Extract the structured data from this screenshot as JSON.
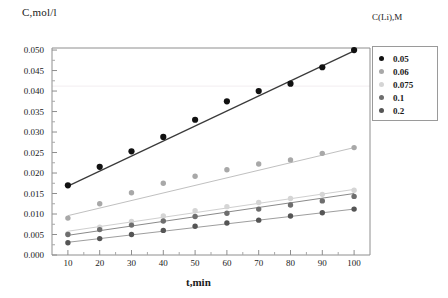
{
  "chart_data": {
    "type": "scatter",
    "title": "",
    "xlabel": "t,min",
    "ylabel": "C,mol/l",
    "xlim": [
      5,
      105
    ],
    "ylim": [
      0.0,
      0.0505
    ],
    "grid": false,
    "legend_position": "right",
    "legend_title": "C(Li),M",
    "xticks": [
      10,
      20,
      30,
      40,
      50,
      60,
      70,
      80,
      90,
      100
    ],
    "yticks": [
      "0.000",
      "0.005",
      "0.010",
      "0.015",
      "0.020",
      "0.025",
      "0.030",
      "0.035",
      "0.040",
      "0.045",
      "0.050"
    ],
    "x": [
      10,
      20,
      30,
      40,
      50,
      60,
      70,
      80,
      90,
      100
    ],
    "series": [
      {
        "name": "0.05",
        "color": "#111111",
        "values": [
          0.017,
          0.0215,
          0.0253,
          0.0288,
          0.033,
          0.0375,
          0.04,
          0.0418,
          0.0458,
          0.05
        ]
      },
      {
        "name": "0.06",
        "color": "#a8a8a8",
        "values": [
          0.009,
          0.0125,
          0.0152,
          0.0175,
          0.0192,
          0.0208,
          0.0222,
          0.0232,
          0.0248,
          0.0262
        ]
      },
      {
        "name": "0.075",
        "color": "#d5d5d5",
        "values": [
          0.0052,
          0.0068,
          0.0082,
          0.0095,
          0.0108,
          0.0118,
          0.0128,
          0.0138,
          0.0148,
          0.0158
        ]
      },
      {
        "name": "0.1",
        "color": "#6e6e6e",
        "values": [
          0.005,
          0.0062,
          0.0073,
          0.0083,
          0.0094,
          0.0102,
          0.0112,
          0.0122,
          0.0132,
          0.0143
        ]
      },
      {
        "name": "0.2",
        "color": "#555555",
        "values": [
          0.003,
          0.004,
          0.005,
          0.006,
          0.007,
          0.0078,
          0.0085,
          0.0095,
          0.0103,
          0.0112
        ]
      }
    ],
    "trendlines": [
      {
        "name": "0.05",
        "color": "#3a3a3a",
        "y0": 0.0168,
        "y1": 0.0498
      },
      {
        "name": "0.06",
        "color": "#c0c0c0",
        "y0": 0.0096,
        "y1": 0.0262
      },
      {
        "name": "0.075",
        "color": "#cfcfcf",
        "y0": 0.0058,
        "y1": 0.016
      },
      {
        "name": "0.1",
        "color": "#8a8a8a",
        "y0": 0.0048,
        "y1": 0.015
      },
      {
        "name": "0.2",
        "color": "#9e9e9e",
        "y0": 0.0031,
        "y1": 0.0112
      }
    ],
    "faint_gridline_y": 0.0412
  }
}
